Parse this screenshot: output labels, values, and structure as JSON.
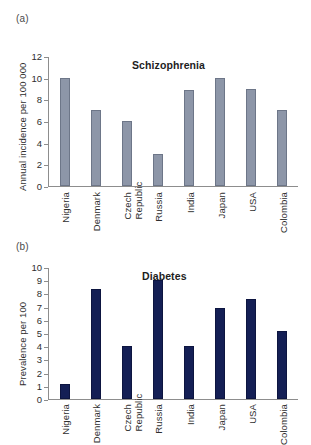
{
  "figure": {
    "panel_a_label": "(a)",
    "panel_b_label": "(b)"
  },
  "chart_data": [
    {
      "type": "bar",
      "panel": "(a)",
      "title": "Schizophrenia",
      "xlabel": "",
      "ylabel": "Annual incidence per 100 000",
      "categories": [
        "Nigeria",
        "Denmark",
        "Czech Republic",
        "Russia",
        "India",
        "Japan",
        "USA",
        "Colombia"
      ],
      "category_lines": [
        [
          "Nigeria"
        ],
        [
          "Denmark"
        ],
        [
          "Czech",
          "Republic"
        ],
        [
          "Russia"
        ],
        [
          "India"
        ],
        [
          "Japan"
        ],
        [
          "USA"
        ],
        [
          "Colombia"
        ]
      ],
      "values": [
        10,
        7,
        6,
        3,
        8.9,
        10,
        9,
        7
      ],
      "ylim": [
        0,
        12
      ],
      "yticks": [
        0,
        2,
        4,
        6,
        8,
        10,
        12
      ],
      "ytick_labels": [
        "0",
        "2",
        "4",
        "6",
        "8",
        "10",
        "12"
      ],
      "grid": false,
      "legend": "none",
      "bar_color": "#8d96a8"
    },
    {
      "type": "bar",
      "panel": "(b)",
      "title": "Diabetes",
      "xlabel": "",
      "ylabel": "Prevalence per 100",
      "categories": [
        "Nigeria",
        "Denmark",
        "Czech Republic",
        "Russia",
        "India",
        "Japan",
        "USA",
        "Colombia"
      ],
      "category_lines": [
        [
          "Nigeria"
        ],
        [
          "Denmark"
        ],
        [
          "Czech",
          "Republic"
        ],
        [
          "Russia"
        ],
        [
          "India"
        ],
        [
          "Japan"
        ],
        [
          "USA"
        ],
        [
          "Colombia"
        ]
      ],
      "values": [
        1.15,
        8.3,
        4.05,
        9.0,
        4.0,
        6.9,
        7.55,
        5.15
      ],
      "ylim": [
        0,
        10
      ],
      "yticks": [
        0,
        1,
        2,
        3,
        4,
        5,
        6,
        7,
        8,
        9,
        10
      ],
      "ytick_labels": [
        "0",
        "1",
        "2",
        "3",
        "4",
        "5",
        "6",
        "7",
        "8",
        "9",
        "10"
      ],
      "grid": false,
      "legend": "none",
      "bar_color": "#141f55"
    }
  ]
}
